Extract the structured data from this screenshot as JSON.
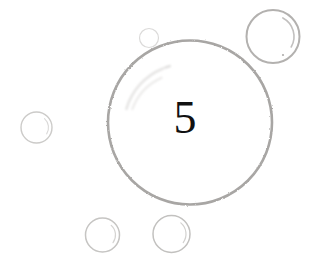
{
  "canvas": {
    "width": 321,
    "height": 273,
    "background_color": "#ffffff"
  },
  "content": {
    "primary_label": "5",
    "primary_label_color": "#111111",
    "primary_label_font_size_px": 46,
    "primary_label_center_x": 185,
    "primary_label_center_y": 118
  },
  "palette": {
    "main_circle_stroke": "#a8a6a4",
    "secondary_circle_stroke": "#b9b8b6",
    "faint_circle_stroke": "#d8d7d6",
    "highlight_arc_stroke": "#c9c8c7",
    "smudge_stroke": "#e2e1e0",
    "dot_fill": "#b0aeac"
  },
  "shapes": {
    "main_circle": {
      "name": "main-bubble",
      "cx": 190,
      "cy": 122.5,
      "r": 82,
      "stroke": "#a8a6a4",
      "stroke_width": 2.6
    },
    "bubbles": [
      {
        "name": "bubble-top-right",
        "cx": 273,
        "cy": 36.5,
        "r": 26.5,
        "stroke": "#b3b1af",
        "stroke_width": 2.0,
        "highlight": {
          "r": 21,
          "start_deg": -62,
          "sweep_deg": 92,
          "stroke": "#c2c0bf",
          "stroke_width": 1.6
        },
        "dot": {
          "x": 283,
          "y": 55,
          "r": 1.1,
          "fill": "#b0aeac"
        }
      },
      {
        "name": "bubble-left",
        "cx": 36.5,
        "cy": 127.5,
        "r": 15.5,
        "stroke": "#cccbc9",
        "stroke_width": 1.4,
        "highlight": {
          "r": 12,
          "start_deg": -48,
          "sweep_deg": 80,
          "stroke": "#dad9d8",
          "stroke_width": 1.1
        },
        "dot": null
      },
      {
        "name": "bubble-bottom-left",
        "cx": 102.5,
        "cy": 235,
        "r": 17,
        "stroke": "#c6c5c3",
        "stroke_width": 1.5,
        "highlight": {
          "r": 13,
          "start_deg": -48,
          "sweep_deg": 84,
          "stroke": "#d5d4d2",
          "stroke_width": 1.2
        },
        "dot": null
      },
      {
        "name": "bubble-bottom-right",
        "cx": 171.5,
        "cy": 234,
        "r": 18.5,
        "stroke": "#c2c1bf",
        "stroke_width": 1.5,
        "highlight": {
          "r": 14.5,
          "start_deg": -50,
          "sweep_deg": 86,
          "stroke": "#d2d1cf",
          "stroke_width": 1.2
        },
        "dot": null
      },
      {
        "name": "bubble-tiny-top",
        "cx": 149,
        "cy": 38,
        "r": 9.5,
        "stroke": "#dbdad9",
        "stroke_width": 1.2,
        "highlight": null,
        "dot": null
      }
    ],
    "smudge_arcs": [
      {
        "name": "smudge-arc-outer",
        "cx": 186,
        "cy": 126,
        "r": 62,
        "start_deg": 196,
        "sweep_deg": 52,
        "stroke": "#e4e3e2",
        "stroke_width": 2.4
      },
      {
        "name": "smudge-arc-inner",
        "cx": 184,
        "cy": 128,
        "r": 55,
        "start_deg": 200,
        "sweep_deg": 46,
        "stroke": "#ebeae9",
        "stroke_width": 2.0
      },
      {
        "name": "smudge-tick",
        "cx": 186,
        "cy": 126,
        "r": 62,
        "start_deg": 250,
        "sweep_deg": 5,
        "stroke": "#dedddc",
        "stroke_width": 2.2
      }
    ]
  }
}
